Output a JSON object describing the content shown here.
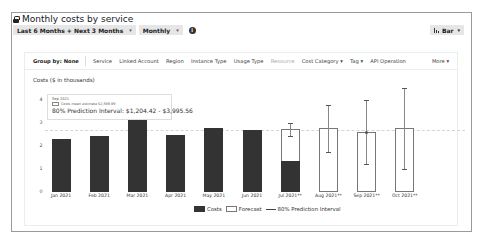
{
  "header": {
    "title": "Monthly costs by service",
    "lock_icon": "lock-icon",
    "time_range": "Last 6 Months + Next 3 Months",
    "granularity": "Monthly",
    "info_icon": "info-icon",
    "chart_type": "Bar"
  },
  "groupby": {
    "label": "Group by:",
    "value": "None",
    "items": [
      "Service",
      "Linked Account",
      "Region",
      "Instance Type",
      "Usage Type",
      "Resource",
      "Cost Category ▾",
      "Tag ▾",
      "API Operation"
    ],
    "more": "More ▾"
  },
  "tooltip": {
    "month": "Sep 2021",
    "mean": "Costs mean estimate $2,599.99",
    "interval": "80% Prediction Interval: $1,204.42 - $3,995.56"
  },
  "legend": {
    "costs": "Costs",
    "forecast": "Forecast",
    "interval": "80% Prediction Interval"
  },
  "chart_data": {
    "type": "bar",
    "title": "Monthly costs by service",
    "ylabel": "Costs ($ in thousands)",
    "xlabel": "",
    "ylim": [
      0,
      4.5
    ],
    "yticks": [
      "0",
      "1",
      "2",
      "3",
      "4"
    ],
    "categories": [
      "Jan 2021",
      "Feb 2021",
      "Mar 2021",
      "Apr 2021",
      "May 2021",
      "Jun 2021",
      "Jul 2021**",
      "Aug 2021**",
      "Sep 2021**",
      "Oct 2021**"
    ],
    "series": [
      {
        "name": "Costs",
        "values": [
          2.3,
          2.43,
          3.25,
          2.48,
          2.78,
          2.7,
          1.35,
          null,
          null,
          null
        ]
      },
      {
        "name": "Forecast",
        "values": [
          null,
          null,
          null,
          null,
          null,
          null,
          2.74,
          2.78,
          2.6,
          2.78
        ]
      },
      {
        "name": "80% Prediction Interval",
        "low": [
          null,
          null,
          null,
          null,
          null,
          null,
          2.44,
          1.74,
          1.2,
          1.0
        ],
        "high": [
          null,
          null,
          null,
          null,
          null,
          null,
          3.0,
          3.78,
          4.0,
          4.52
        ]
      }
    ],
    "reference_line": 2.7,
    "legend_position": "bottom",
    "grid": false
  }
}
